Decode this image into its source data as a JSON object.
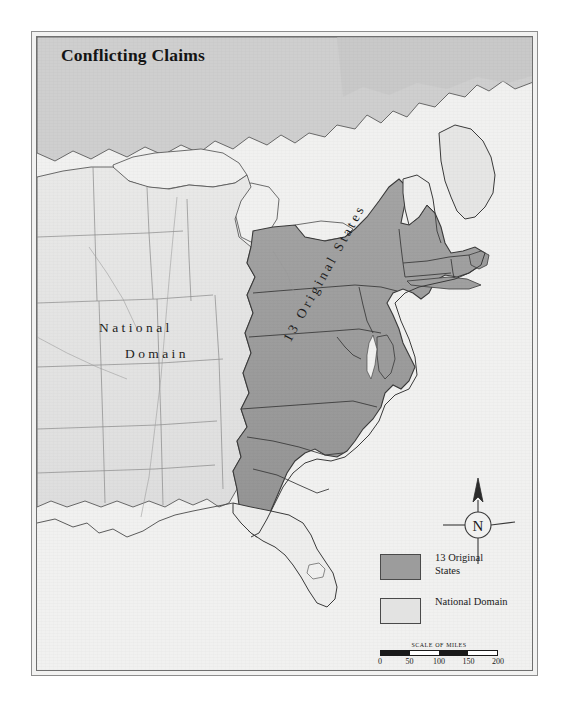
{
  "title": "Conflicting Claims",
  "map_labels": {
    "national_domain_line1": "National",
    "national_domain_line2": "Domain",
    "original_states": "13 Original States"
  },
  "legend": {
    "items": [
      {
        "swatch": "dark",
        "line1": "13 Original",
        "line2": "States",
        "color": "#9c9c9c"
      },
      {
        "swatch": "light",
        "line1": "National Domain",
        "line2": "",
        "color": "#e3e3e2"
      }
    ]
  },
  "scale": {
    "caption": "Scale of Miles",
    "ticks": [
      "0",
      "50",
      "100",
      "150",
      "200"
    ],
    "max_miles": 200,
    "units": "miles"
  },
  "compass": {
    "north_label": "N"
  },
  "colors": {
    "original_states_fill": "#9c9c9c",
    "national_domain_fill": "#e3e3e2",
    "canada_fill": "#cfcfcf",
    "water_fill": "#f1f1f0",
    "outline": "#3a3a3a",
    "frame": "#6f6f6f",
    "paper": "#f1f1f0",
    "title_color": "#141414"
  }
}
